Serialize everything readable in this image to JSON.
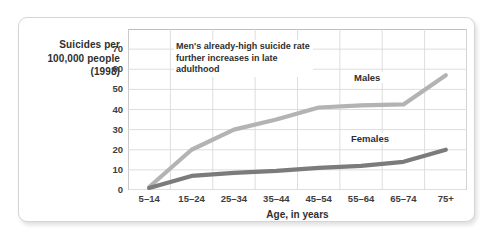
{
  "figure": {
    "y_axis_caption_lines": [
      "Suicides per",
      "100,000 people",
      "(1998)"
    ],
    "annotation": "Men's already-high suicide rate further increases in late adulthood",
    "series_labels": {
      "males": "Males",
      "females": "Females"
    },
    "colors": {
      "males_line": "#b3b3b3",
      "females_line": "#7b7b7b",
      "grid": "#d9d9d9",
      "axis": "#bdbdbd",
      "card_border": "#d5d5d5",
      "text": "#2f2f2f"
    }
  },
  "chart_data": {
    "type": "line",
    "title": "",
    "xlabel": "Age, in years",
    "ylabel": "Suicides per 100,000 people (1998)",
    "categories": [
      "5–14",
      "15–24",
      "25–34",
      "35–44",
      "45–54",
      "55–64",
      "65–74",
      "75+"
    ],
    "yticks": [
      0,
      10,
      20,
      30,
      40,
      50,
      60,
      70
    ],
    "ylim": [
      0,
      80
    ],
    "grid": true,
    "legend": "inline-labels",
    "series": [
      {
        "name": "Males",
        "values": [
          1.5,
          20,
          30,
          35,
          41,
          42,
          42.5,
          57
        ]
      },
      {
        "name": "Females",
        "values": [
          1,
          7,
          8.5,
          9.5,
          11,
          12,
          14,
          20
        ]
      }
    ],
    "annotations": [
      {
        "text": "Men's already-high suicide rate further increases in late adulthood",
        "target": "Males"
      }
    ]
  }
}
